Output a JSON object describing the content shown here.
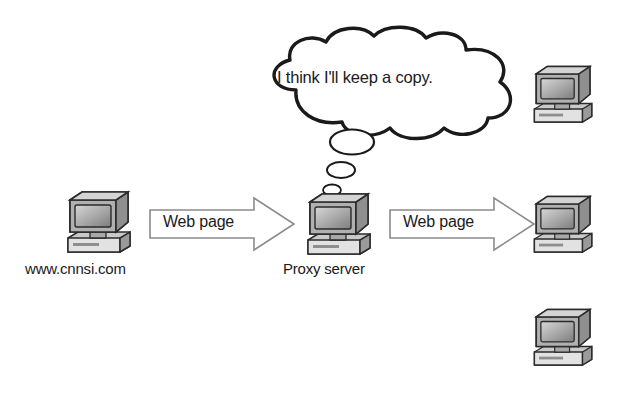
{
  "diagram": {
    "background_color": "#ffffff",
    "line_color": "#1a1a1a",
    "monitor_color": "#8c8c8c"
  },
  "thought_bubble": {
    "text": "I think I'll keep a copy.",
    "tail_dots": 3
  },
  "arrows": [
    {
      "label": "Web page",
      "direction": "right"
    },
    {
      "label": "Web page",
      "direction": "right"
    }
  ],
  "nodes": [
    {
      "id": "origin-server",
      "label": "www.cnnsi.com",
      "icon": "computer-icon"
    },
    {
      "id": "proxy-server",
      "label": "Proxy server",
      "icon": "computer-icon"
    },
    {
      "id": "client-top",
      "label": "",
      "icon": "computer-icon"
    },
    {
      "id": "client-middle",
      "label": "",
      "icon": "computer-icon"
    },
    {
      "id": "client-bottom",
      "label": "",
      "icon": "computer-icon"
    }
  ]
}
